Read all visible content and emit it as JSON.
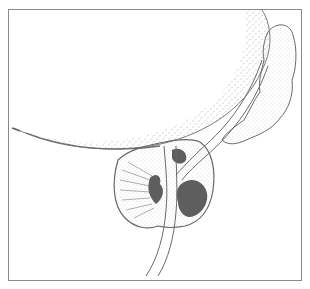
{
  "figure": {
    "type": "anatomical line illustration",
    "colors": {
      "line": "#6a6a6a",
      "stipple": "#9a9a9a",
      "lesion": "#5e5e5e",
      "frame": "#8a8a8a",
      "background": "#ffffff"
    }
  }
}
